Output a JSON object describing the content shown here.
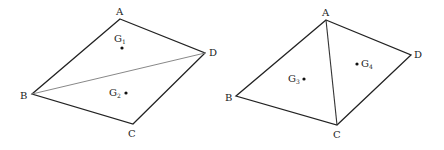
{
  "figures": [
    {
      "name": "left-quadrilateral",
      "vertices": {
        "A": {
          "label": "A",
          "x": 120,
          "y": 19
        },
        "B": {
          "label": "B",
          "x": 32,
          "y": 94
        },
        "C": {
          "label": "C",
          "x": 133,
          "y": 124
        },
        "D": {
          "label": "D",
          "x": 205,
          "y": 53
        }
      },
      "diagonal": "BD",
      "centroids": [
        {
          "label": "G",
          "sub": "1",
          "x": 122,
          "y": 48
        },
        {
          "label": "G",
          "sub": "2",
          "x": 126,
          "y": 93
        }
      ]
    },
    {
      "name": "right-quadrilateral",
      "vertices": {
        "A": {
          "label": "A",
          "x": 326,
          "y": 20
        },
        "B": {
          "label": "B",
          "x": 236,
          "y": 96
        },
        "C": {
          "label": "C",
          "x": 337,
          "y": 125
        },
        "D": {
          "label": "D",
          "x": 411,
          "y": 55
        }
      },
      "diagonal": "AC",
      "centroids": [
        {
          "label": "G",
          "sub": "3",
          "x": 304,
          "y": 79
        },
        {
          "label": "G",
          "sub": "4",
          "x": 357,
          "y": 64
        }
      ]
    }
  ],
  "colors": {
    "edge": "#222222",
    "diagonal_left": "#888888",
    "diagonal_right": "#333333"
  }
}
